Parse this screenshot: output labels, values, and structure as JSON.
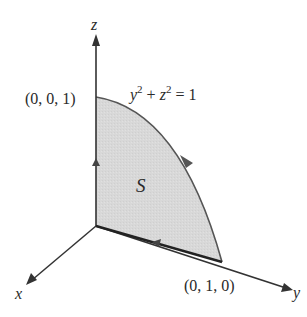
{
  "figure": {
    "axes": {
      "x_label": "x",
      "y_label": "y",
      "z_label": "z"
    },
    "points": {
      "top": "(0, 0, 1)",
      "right": "(0, 1, 0)"
    },
    "curve_equation": {
      "y": "y",
      "y_exp": "2",
      "plus": " + ",
      "z": "z",
      "z_exp": "2",
      "rhs": " = 1"
    },
    "surface_label": "S",
    "colors": {
      "surface_fill": "#d6d6d6",
      "stroke": "#333333",
      "boundary_curve": "#555555"
    }
  }
}
